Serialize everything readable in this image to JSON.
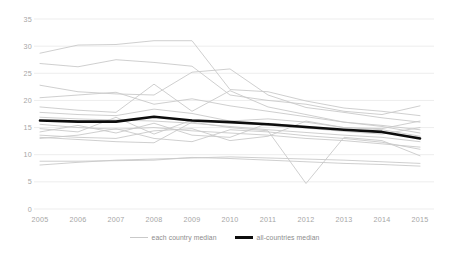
{
  "chart_data": {
    "type": "line",
    "title": "",
    "subtitle": "",
    "xlabel": "",
    "ylabel": "",
    "x": [
      2005,
      2006,
      2007,
      2008,
      2009,
      2010,
      2011,
      2012,
      2013,
      2014,
      2015
    ],
    "xticklabels": [
      "2005",
      "2006",
      "2007",
      "2008",
      "2009",
      "2010",
      "2011",
      "2012",
      "2013",
      "2014",
      "2015"
    ],
    "yticks": [
      0,
      5,
      10,
      15,
      20,
      25,
      30,
      35
    ],
    "yticklabels": [
      "0",
      "5",
      "10",
      "15",
      "20",
      "25",
      "30",
      "35"
    ],
    "ylim": [
      0,
      35
    ],
    "xlim": [
      2005,
      2015
    ],
    "grid": "horizontal",
    "legend_position": "bottom-center",
    "colors": {
      "country_lines": "#c9c9c9",
      "median_line": "#0d0d0d",
      "gridlines": "#ededed",
      "tick_text": "#a6a6a6",
      "legend_text": "#8c8c8c",
      "background": "#ffffff"
    },
    "legend": [
      {
        "label": "each country median",
        "style": "thin-gray-line"
      },
      {
        "label": "all-countries median",
        "style": "thick-black-line"
      }
    ],
    "series": [
      {
        "name": "all-countries median",
        "emphasis": "thick-black",
        "values": [
          16.3,
          16.1,
          16.1,
          17.0,
          16.3,
          16.0,
          15.6,
          15.1,
          14.6,
          14.2,
          13.0
        ]
      },
      {
        "name": "country 1",
        "emphasis": "thin-gray",
        "values": [
          28.7,
          30.2,
          30.3,
          31.0,
          31.0,
          22.0,
          21.6,
          19.9,
          18.6,
          18.0,
          17.2
        ]
      },
      {
        "name": "country 2",
        "emphasis": "thin-gray",
        "values": [
          26.8,
          26.2,
          27.5,
          27.0,
          26.3,
          21.0,
          20.0,
          19.3,
          18.0,
          17.4,
          19.0
        ]
      },
      {
        "name": "country 3",
        "emphasis": "thin-gray",
        "values": [
          22.8,
          21.6,
          21.2,
          21.0,
          25.2,
          25.8,
          21.0,
          18.7,
          17.8,
          16.8,
          16.0
        ]
      },
      {
        "name": "country 4",
        "emphasis": "thin-gray",
        "values": [
          20.5,
          21.0,
          21.5,
          19.3,
          20.3,
          19.0,
          18.0,
          17.0,
          16.0,
          15.2,
          14.0
        ]
      },
      {
        "name": "country 5",
        "emphasis": "thin-gray",
        "values": [
          18.8,
          18.2,
          17.8,
          23.0,
          18.0,
          21.8,
          18.8,
          17.4,
          16.0,
          15.4,
          14.6
        ]
      },
      {
        "name": "country 6",
        "emphasis": "thin-gray",
        "values": [
          17.8,
          17.4,
          17.2,
          18.4,
          17.6,
          16.2,
          16.6,
          16.0,
          15.0,
          14.6,
          13.4
        ]
      },
      {
        "name": "country 7",
        "emphasis": "thin-gray",
        "values": [
          16.9,
          16.6,
          16.4,
          16.2,
          15.8,
          15.2,
          14.6,
          14.1,
          13.6,
          13.2,
          12.4
        ]
      },
      {
        "name": "country 8",
        "emphasis": "thin-gray",
        "values": [
          15.6,
          15.0,
          14.7,
          15.0,
          14.4,
          14.0,
          13.6,
          13.0,
          12.6,
          12.0,
          11.4
        ]
      },
      {
        "name": "country 9",
        "emphasis": "thin-gray",
        "values": [
          14.8,
          14.2,
          16.9,
          13.8,
          16.4,
          16.0,
          15.4,
          14.9,
          14.3,
          13.8,
          15.0
        ]
      },
      {
        "name": "country 10",
        "emphasis": "thin-gray",
        "values": [
          14.2,
          15.4,
          14.0,
          15.8,
          13.6,
          13.2,
          15.8,
          15.2,
          14.6,
          14.1,
          13.2
        ]
      },
      {
        "name": "country 11",
        "emphasis": "thin-gray",
        "values": [
          13.6,
          13.2,
          13.0,
          14.4,
          14.8,
          12.6,
          13.4,
          16.2,
          15.0,
          14.8,
          16.2
        ]
      },
      {
        "name": "country 12",
        "emphasis": "thin-gray",
        "values": [
          13.0,
          13.6,
          14.8,
          13.0,
          12.4,
          14.6,
          14.2,
          13.5,
          13.0,
          12.3,
          11.0
        ]
      },
      {
        "name": "country 13",
        "emphasis": "thin-gray",
        "values": [
          13.2,
          12.8,
          12.4,
          12.2,
          16.0,
          15.0,
          14.4,
          4.7,
          13.2,
          12.6,
          9.8
        ]
      },
      {
        "name": "country 14",
        "emphasis": "thin-gray",
        "values": [
          8.1,
          8.6,
          9.0,
          9.2,
          9.4,
          9.6,
          9.4,
          9.2,
          9.0,
          8.7,
          8.4
        ]
      },
      {
        "name": "country 15",
        "emphasis": "thin-gray",
        "values": [
          8.8,
          8.8,
          8.9,
          9.0,
          9.5,
          9.3,
          9.0,
          8.7,
          8.4,
          8.2,
          7.9
        ]
      }
    ]
  },
  "axes": {
    "y_labels": [
      "35",
      "30",
      "25",
      "20",
      "15",
      "10",
      "5",
      "0"
    ],
    "x_labels": [
      "2005",
      "2006",
      "2007",
      "2008",
      "2009",
      "2010",
      "2011",
      "2012",
      "2013",
      "2014",
      "2015"
    ]
  },
  "legend": {
    "entries": [
      {
        "label": "each country median"
      },
      {
        "label": "all-countries median"
      }
    ]
  }
}
